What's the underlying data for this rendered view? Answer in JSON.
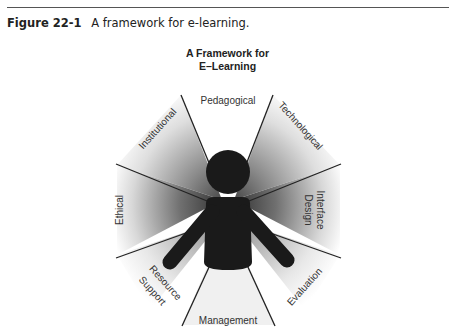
{
  "caption": {
    "figure_number": "Figure 22-1",
    "text": "A framework for e-learning."
  },
  "diagram": {
    "title_line1": "A Framework for",
    "title_line2": "E–Learning",
    "center_figure": "person",
    "dimensions": [
      {
        "label": "Pedagogical"
      },
      {
        "label": "Technological"
      },
      {
        "label": "Interface"
      },
      {
        "label": "Design"
      },
      {
        "label": "Evaluation"
      },
      {
        "label": "Management"
      },
      {
        "label": "Resource"
      },
      {
        "label": "Support"
      },
      {
        "label": "Ethical"
      },
      {
        "label": "Institutional"
      }
    ]
  },
  "colors": {
    "figure": "#1a1a1a",
    "lines": "#222222",
    "shade_dark": "#4a4a4a",
    "background": "#ffffff"
  }
}
